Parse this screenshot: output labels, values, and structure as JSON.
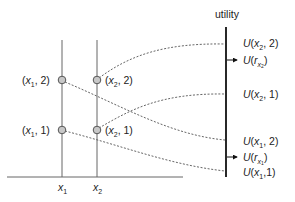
{
  "axis": {
    "title": "utility",
    "x_labels": [
      {
        "var": "x",
        "sub": "1"
      },
      {
        "var": "x",
        "sub": "2"
      }
    ]
  },
  "points": [
    {
      "id": "x1-2",
      "var": "x",
      "sub": "1",
      "val": "2",
      "label_text": ", 2)"
    },
    {
      "id": "x1-1",
      "var": "x",
      "sub": "1",
      "val": "1",
      "label_text": ", 1)"
    },
    {
      "id": "x2-2",
      "var": "x",
      "sub": "2",
      "val": "2",
      "label_text": ", 2)"
    },
    {
      "id": "x2-1",
      "var": "x",
      "sub": "2",
      "val": "1",
      "label_text": ", 1)"
    }
  ],
  "utility_labels": [
    {
      "id": "U-x2-2",
      "prefix": "U(",
      "var": "x",
      "sub": "2",
      "rest": ", 2)"
    },
    {
      "id": "U-r-x2",
      "prefix": "U(",
      "var": "r",
      "sub": "x",
      "subsub": "2",
      "rest": ")",
      "arrow": true
    },
    {
      "id": "U-x2-1",
      "prefix": "U(",
      "var": "x",
      "sub": "2",
      "rest": ", 1)"
    },
    {
      "id": "U-x1-2",
      "prefix": "U(",
      "var": "x",
      "sub": "1",
      "rest": ", 2)"
    },
    {
      "id": "U-r-x1",
      "prefix": "U(",
      "var": "r",
      "sub": "x",
      "subsub": "1",
      "rest": ")",
      "arrow": true
    },
    {
      "id": "U-x1-1",
      "prefix": "U(",
      "var": "x",
      "sub": "1",
      "rest": ",1)"
    }
  ],
  "open_paren": "(",
  "colors": {
    "line": "#555555",
    "axis": "#111111",
    "dash": "#555555",
    "node_fill": "#c8c8c8",
    "node_stroke": "#555555"
  }
}
